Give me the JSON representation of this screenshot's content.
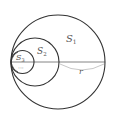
{
  "diagram": {
    "circles": [
      {
        "name": "S1",
        "cx": 58,
        "cy": 62,
        "r": 47
      },
      {
        "name": "S2",
        "cx": 35,
        "cy": 62,
        "r": 24
      },
      {
        "name": "S3",
        "cx": 22.5,
        "cy": 62,
        "r": 11.5
      }
    ],
    "labels": {
      "s1": {
        "main": "S",
        "sub": "1"
      },
      "s2": {
        "main": "S",
        "sub": "2"
      },
      "s3": {
        "main": "S",
        "sub": "3"
      },
      "radius": "r",
      "ellipsis": "···"
    },
    "colors": {
      "stroke": "#333333",
      "arc": "#bbbbbb",
      "text": "#555555"
    }
  }
}
